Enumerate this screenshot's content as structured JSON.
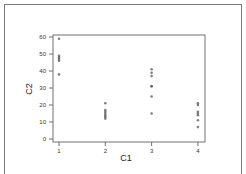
{
  "chart_data": {
    "type": "scatter",
    "title": "",
    "xlabel": "C1",
    "ylabel": "C2",
    "x_ticks": [
      "1",
      "2",
      "3",
      "4"
    ],
    "y_ticks": [
      "0",
      "10",
      "20",
      "30",
      "40",
      "50",
      "60"
    ],
    "xlim": [
      0.85,
      4.2
    ],
    "ylim": [
      -2,
      62
    ],
    "grid": false,
    "legend": null,
    "marker_color": "#555555",
    "series": [
      {
        "name": "C2 vs C1",
        "points": [
          {
            "x": 1,
            "y": 59
          },
          {
            "x": 1,
            "y": 49
          },
          {
            "x": 1,
            "y": 48
          },
          {
            "x": 1,
            "y": 47
          },
          {
            "x": 1,
            "y": 46
          },
          {
            "x": 1,
            "y": 38
          },
          {
            "x": 2,
            "y": 21
          },
          {
            "x": 2,
            "y": 17
          },
          {
            "x": 2,
            "y": 16
          },
          {
            "x": 2,
            "y": 15
          },
          {
            "x": 2,
            "y": 14
          },
          {
            "x": 2,
            "y": 13
          },
          {
            "x": 2,
            "y": 12
          },
          {
            "x": 3,
            "y": 41
          },
          {
            "x": 3,
            "y": 39
          },
          {
            "x": 3,
            "y": 37
          },
          {
            "x": 3,
            "y": 31
          },
          {
            "x": 3,
            "y": 31
          },
          {
            "x": 3,
            "y": 25
          },
          {
            "x": 3,
            "y": 15
          },
          {
            "x": 4,
            "y": 21
          },
          {
            "x": 4,
            "y": 20
          },
          {
            "x": 4,
            "y": 16
          },
          {
            "x": 4,
            "y": 15
          },
          {
            "x": 4,
            "y": 14
          },
          {
            "x": 4,
            "y": 11
          },
          {
            "x": 4,
            "y": 7
          }
        ]
      }
    ]
  }
}
